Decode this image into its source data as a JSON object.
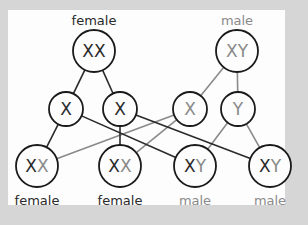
{
  "colors": {
    "background": "#d6d6d6",
    "panel": "#fdfdfd",
    "maternal": "#2a2a2a",
    "paternal": "#8a8a8a"
  },
  "parents": [
    {
      "label": "female",
      "genotype": [
        "X",
        "X"
      ],
      "cx": 94,
      "cy": 51
    },
    {
      "label": "male",
      "genotype": [
        "X",
        "Y"
      ],
      "cx": 237,
      "cy": 51
    }
  ],
  "gametes": [
    {
      "allele": "X",
      "parent": 0,
      "cx": 66,
      "cy": 109
    },
    {
      "allele": "X",
      "parent": 0,
      "cx": 120,
      "cy": 109
    },
    {
      "allele": "X",
      "parent": 1,
      "cx": 190,
      "cy": 109
    },
    {
      "allele": "Y",
      "parent": 1,
      "cx": 238,
      "cy": 109
    }
  ],
  "offspring": [
    {
      "label": "female",
      "genotype": [
        "X",
        "X"
      ],
      "cx": 37,
      "cy": 166,
      "from": [
        0,
        2
      ]
    },
    {
      "label": "female",
      "genotype": [
        "X",
        "X"
      ],
      "cx": 120,
      "cy": 166,
      "from": [
        1,
        2
      ]
    },
    {
      "label": "male",
      "genotype": [
        "X",
        "Y"
      ],
      "cx": 195,
      "cy": 166,
      "from": [
        0,
        3
      ]
    },
    {
      "label": "male",
      "genotype": [
        "X",
        "Y"
      ],
      "cx": 270,
      "cy": 166,
      "from": [
        1,
        3
      ]
    }
  ]
}
